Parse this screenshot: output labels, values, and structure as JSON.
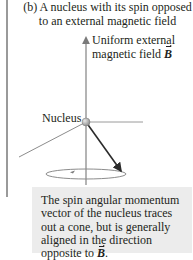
{
  "title": {
    "line1": "(b) A nucleus with its spin opposed",
    "line2": "to an external magnetic field"
  },
  "field_label": {
    "line1": "Uniform external",
    "line2_prefix": "magnetic field ",
    "symbol": "B"
  },
  "nucleus_label": "Nucleus",
  "note": {
    "line1": "The spin angular momentum",
    "line2": "vector of the nucleus traces",
    "line3": "out a cone, but is generally",
    "line4": "aligned in the direction",
    "line5_prefix": "opposite to ",
    "symbol": "B",
    "line5_suffix": "."
  },
  "colors": {
    "axis": "#8c8c8c",
    "spin_vector": "#2b2b2b",
    "note_background": "#ececec",
    "nucleus": "#a6a6a6"
  }
}
